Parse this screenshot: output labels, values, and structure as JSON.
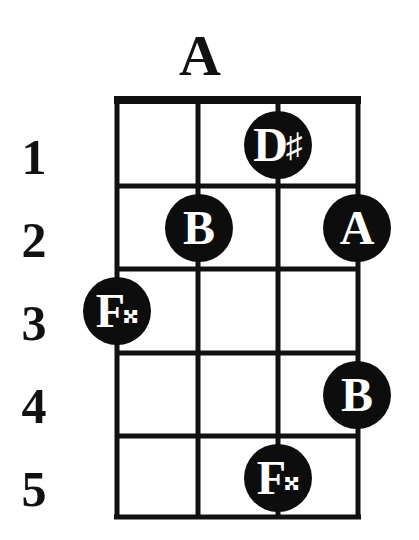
{
  "diagram": {
    "title": "A",
    "fret_numbers": [
      "1",
      "2",
      "3",
      "4",
      "5"
    ],
    "strings": 4,
    "frets": 5,
    "colors": {
      "line": "#111111",
      "dot": "#0d0d0d",
      "dot_text": "#ffffff",
      "background": "#ffffff"
    },
    "notes": [
      {
        "string": 3,
        "fret": 1,
        "note": "D",
        "accidental": "♯"
      },
      {
        "string": 2,
        "fret": 2,
        "note": "B",
        "accidental": ""
      },
      {
        "string": 4,
        "fret": 2,
        "note": "A",
        "accidental": ""
      },
      {
        "string": 1,
        "fret": 3,
        "note": "F",
        "accidental": "𝄪"
      },
      {
        "string": 4,
        "fret": 4,
        "note": "B",
        "accidental": ""
      },
      {
        "string": 3,
        "fret": 5,
        "note": "F",
        "accidental": "𝄪"
      }
    ]
  }
}
